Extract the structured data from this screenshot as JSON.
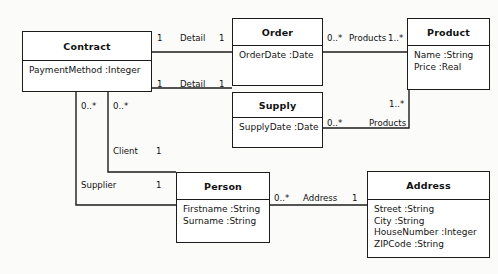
{
  "diagram": {
    "kind": "uml-class-diagram",
    "background_color": "#fbfbfa",
    "line_color": "#1c1c1c",
    "text_color": "#111111"
  },
  "classes": [
    {
      "id": "contract",
      "name": "Contract",
      "x": 22,
      "y": 31,
      "width": 130,
      "height": 61,
      "header_height": 29,
      "attributes": [
        "PaymentMethod :Integer"
      ]
    },
    {
      "id": "order",
      "name": "Order",
      "x": 232,
      "y": 18,
      "width": 91,
      "height": 68,
      "header_height": 27,
      "attributes": [
        "OrderDate :Date"
      ]
    },
    {
      "id": "product",
      "name": "Product",
      "x": 407,
      "y": 18,
      "width": 83,
      "height": 72,
      "header_height": 27,
      "attributes": [
        "Name :String",
        "Price :Real"
      ]
    },
    {
      "id": "supply",
      "name": "Supply",
      "x": 232,
      "y": 92,
      "width": 91,
      "height": 56,
      "header_height": 25,
      "attributes": [
        "SupplyDate :Date"
      ]
    },
    {
      "id": "person",
      "name": "Person",
      "x": 176,
      "y": 172,
      "width": 94,
      "height": 71,
      "header_height": 27,
      "attributes": [
        "Firstname :String",
        "Surname :String"
      ]
    },
    {
      "id": "address",
      "name": "Address",
      "x": 367,
      "y": 171,
      "width": 123,
      "height": 87,
      "header_height": 28,
      "attributes": [
        "Street :String",
        "City :String",
        "HouseNumber :Integer",
        "ZIPCode :String"
      ]
    }
  ],
  "associations": [
    {
      "id": "contract-order",
      "from": "contract",
      "to": "order",
      "name": "Detail",
      "source_multiplicity": "1",
      "target_multiplicity": "1",
      "path": "M 152 52 L 232 52"
    },
    {
      "id": "contract-supply",
      "from": "contract",
      "to": "supply",
      "name": "Detail",
      "source_multiplicity": "1",
      "target_multiplicity": "1",
      "path": "M 152 88 L 232 88"
    },
    {
      "id": "order-product",
      "from": "order",
      "to": "product",
      "name": "Products",
      "source_multiplicity": "0..*",
      "target_multiplicity": "1..*",
      "path": "M 323 52 L 407 52"
    },
    {
      "id": "supply-product",
      "from": "supply",
      "to": "product",
      "name": "Products",
      "source_multiplicity": "0..*",
      "target_multiplicity": "1..*",
      "path": "M 323 128 L 409 128 L 409 90"
    },
    {
      "id": "contract-person-client",
      "from": "contract",
      "to": "person",
      "name": "Client",
      "source_multiplicity": "0..*",
      "target_multiplicity": "1",
      "path": "M 108 92 L 108 172 L 176 172"
    },
    {
      "id": "contract-person-supplier",
      "from": "contract",
      "to": "person",
      "name": "Supplier",
      "source_multiplicity": "0..*",
      "target_multiplicity": "1",
      "path": "M 76 92 L 76 205 L 176 205"
    },
    {
      "id": "person-address",
      "from": "person",
      "to": "address",
      "name": "Address",
      "source_multiplicity": "0..*",
      "target_multiplicity": "1",
      "path": "M 270 205 L 367 205"
    }
  ],
  "edge_labels": [
    {
      "id": "lbl-detail-order-src",
      "text": "1",
      "x": 157,
      "y": 33
    },
    {
      "id": "lbl-detail-order-name",
      "text": "Detail",
      "x": 180,
      "y": 33
    },
    {
      "id": "lbl-detail-order-tgt",
      "text": "1",
      "x": 219,
      "y": 33
    },
    {
      "id": "lbl-detail-supply-src",
      "text": "1",
      "x": 157,
      "y": 79
    },
    {
      "id": "lbl-detail-supply-name",
      "text": "Detail",
      "x": 180,
      "y": 79
    },
    {
      "id": "lbl-detail-supply-tgt",
      "text": "1",
      "x": 219,
      "y": 79
    },
    {
      "id": "lbl-prod-order-src",
      "text": "0..*",
      "x": 327,
      "y": 33
    },
    {
      "id": "lbl-prod-order-name",
      "text": "Products",
      "x": 349,
      "y": 33
    },
    {
      "id": "lbl-prod-order-tgt",
      "text": "1..*",
      "x": 388,
      "y": 33
    },
    {
      "id": "lbl-prod-supply-src",
      "text": "0..*",
      "x": 327,
      "y": 118
    },
    {
      "id": "lbl-prod-supply-name",
      "text": "Products",
      "x": 369,
      "y": 118
    },
    {
      "id": "lbl-prod-supply-tgt",
      "text": "1..*",
      "x": 389,
      "y": 99
    },
    {
      "id": "lbl-client-src",
      "text": "0..*",
      "x": 113,
      "y": 101
    },
    {
      "id": "lbl-client-name",
      "text": "Client",
      "x": 113,
      "y": 146
    },
    {
      "id": "lbl-client-tgt",
      "text": "1",
      "x": 156,
      "y": 146
    },
    {
      "id": "lbl-supplier-src",
      "text": "0..*",
      "x": 81,
      "y": 101
    },
    {
      "id": "lbl-supplier-name",
      "text": "Supplier",
      "x": 81,
      "y": 180
    },
    {
      "id": "lbl-supplier-tgt",
      "text": "1",
      "x": 156,
      "y": 180
    },
    {
      "id": "lbl-address-src",
      "text": "0..*",
      "x": 274,
      "y": 193
    },
    {
      "id": "lbl-address-name",
      "text": "Address",
      "x": 303,
      "y": 193
    },
    {
      "id": "lbl-address-tgt",
      "text": "1",
      "x": 352,
      "y": 193
    }
  ]
}
